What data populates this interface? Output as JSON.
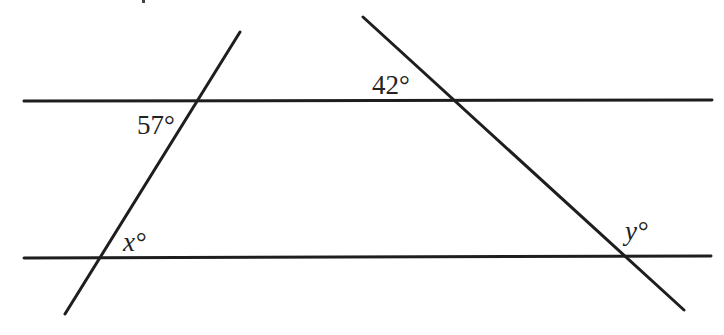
{
  "diagram": {
    "colors": {
      "background": "#ffffff",
      "stroke": "#1e1e1e",
      "text": "#222222"
    },
    "lines": {
      "top_parallel": {
        "x1": 24,
        "y1": 101,
        "x2": 712,
        "y2": 100
      },
      "bottom_parallel": {
        "x1": 24,
        "y1": 258,
        "x2": 711,
        "y2": 256
      },
      "left_transversal": {
        "x1": 240,
        "y1": 32,
        "x2": 65,
        "y2": 314
      },
      "right_transversal": {
        "x1": 363,
        "y1": 17,
        "x2": 684,
        "y2": 310
      }
    },
    "angles": [
      {
        "id": "angle-57",
        "value": "57",
        "text": "57°",
        "x": 137,
        "y": 134,
        "italic": false
      },
      {
        "id": "angle-42",
        "value": "42",
        "text": "42°",
        "x": 372,
        "y": 94,
        "italic": false
      },
      {
        "id": "angle-x",
        "value": "x",
        "text": "x°",
        "x": 123,
        "y": 251,
        "italic": true
      },
      {
        "id": "angle-y",
        "value": "y",
        "text": "y°",
        "x": 625,
        "y": 240,
        "italic": true
      }
    ]
  }
}
